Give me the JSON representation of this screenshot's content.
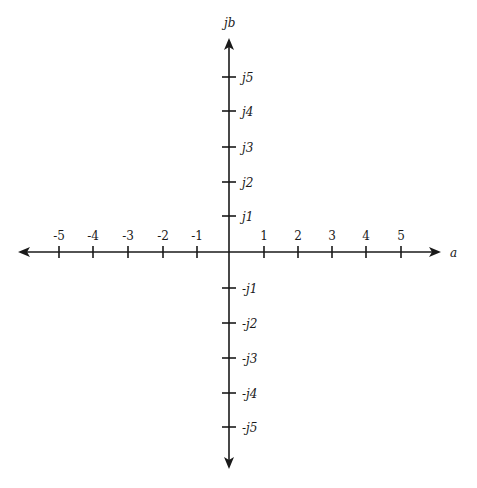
{
  "diagram": {
    "axis_labels": {
      "horizontal": "a",
      "vertical": "jb"
    },
    "colors": {
      "ink": "#1a1a1a",
      "background": "#ffffff"
    },
    "horizontal_ticks": [
      {
        "label": "-5",
        "x": 59
      },
      {
        "label": "-4",
        "x": 93
      },
      {
        "label": "-3",
        "x": 128
      },
      {
        "label": "-2",
        "x": 163
      },
      {
        "label": "-1",
        "x": 197
      },
      {
        "label": "1",
        "x": 264
      },
      {
        "label": "2",
        "x": 298
      },
      {
        "label": "3",
        "x": 332
      },
      {
        "label": "4",
        "x": 366
      },
      {
        "label": "5",
        "x": 401
      }
    ],
    "vertical_ticks": [
      {
        "label": "j5",
        "y": 77
      },
      {
        "label": "j4",
        "y": 111
      },
      {
        "label": "j3",
        "y": 147
      },
      {
        "label": "j2",
        "y": 182
      },
      {
        "label": "j1",
        "y": 216
      },
      {
        "label": "-j1",
        "y": 288
      },
      {
        "label": "-j2",
        "y": 323
      },
      {
        "label": "-j3",
        "y": 358
      },
      {
        "label": "-j4",
        "y": 393
      },
      {
        "label": "-j5",
        "y": 427
      }
    ]
  }
}
